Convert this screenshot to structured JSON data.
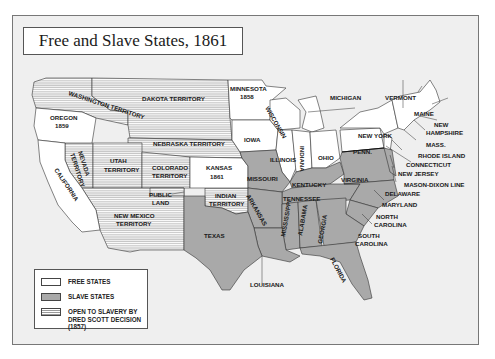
{
  "title": "Free and Slave States, 1861",
  "legend": {
    "items": [
      {
        "key": "free",
        "label": "FREE STATES"
      },
      {
        "key": "slave",
        "label": "SLAVE STATES"
      },
      {
        "key": "open",
        "label": "OPEN TO SLAVERY BY\nDRED SCOTT DECISION (1857)"
      }
    ]
  },
  "colors": {
    "free": "#ffffff",
    "slave": "#a9a9a9",
    "open_stripe": "#9a9a9a",
    "background": "#efefef",
    "border": "#555555"
  },
  "regions": {
    "washington": "WASHINGTON TERRITORY",
    "dakota": "DAKOTA TERRITORY",
    "oregon": "OREGON",
    "oregon_year": "1859",
    "minnesota": "MINNESOTA",
    "minnesota_year": "1858",
    "wisconsin": "WISCONSIN",
    "michigan": "MICHIGAN",
    "vermont": "VERMONT",
    "maine": "MAINE",
    "new_hampshire_1": "NEW",
    "new_hampshire_2": "HAMPSHIRE",
    "mass": "MASS.",
    "rhode_island": "RHODE ISLAND",
    "connecticut": "CONNECTICUT",
    "new_jersey": "NEW JERSEY",
    "mason_dixon": "MASON-DIXON LINE",
    "delaware": "DELAWARE",
    "maryland": "MARYLAND",
    "north_carolina_1": "NORTH",
    "north_carolina_2": "CAROLINA",
    "south_carolina_1": "SOUTH",
    "south_carolina_2": "CAROLINA",
    "new_york": "NEW YORK",
    "penn": "PENN.",
    "ohio": "OHIO",
    "indiana": "INDIANA",
    "illinois": "ILLINOIS",
    "iowa": "IOWA",
    "nebraska": "NEBRASKA TERRITORY",
    "nevada_1": "NEVADA",
    "nevada_2": "TERRITORY",
    "utah_1": "UTAH",
    "utah_2": "TERRITORY",
    "colorado_1": "COLORADO",
    "colorado_2": "TERRITORY",
    "kansas": "KANSAS",
    "kansas_year": "1861",
    "california": "CALIFORNIA",
    "public_land_1": "PUBLIC",
    "public_land_2": "LAND",
    "indian_1": "INDIAN",
    "indian_2": "TERRITORY",
    "new_mexico_1": "NEW MEXICO",
    "new_mexico_2": "TERRITORY",
    "missouri": "MISSOURI",
    "kentucky": "KENTUCKY",
    "virginia": "VIRGINIA",
    "tennessee": "TENNESSEE",
    "arkansas": "ARKANSAS",
    "mississippi": "MISSISSIPPI",
    "alabama": "ALABAMA",
    "georgia": "GEORGIA",
    "texas": "TEXAS",
    "louisiana": "LOUISIANA",
    "florida": "FLORIDA"
  }
}
